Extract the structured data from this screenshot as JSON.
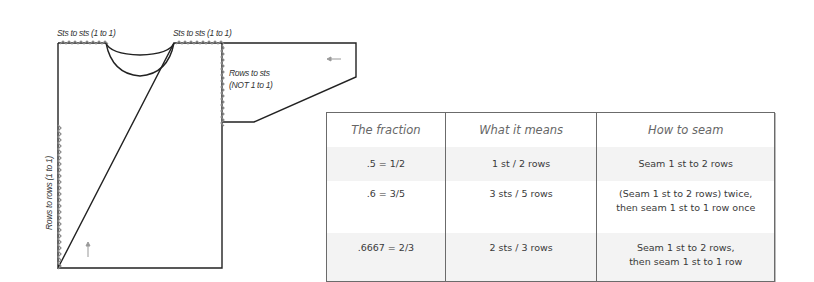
{
  "diagram": {
    "labels": {
      "shoulder_left": "Sts to sts (1 to 1)",
      "shoulder_right": "Sts to sts (1 to 1)",
      "armhole_line1": "Rows to sts",
      "armhole_line2": "(NOT 1 to 1)",
      "side": "Rows to rows (1 to 1)"
    },
    "arrows": [
      {
        "name": "sleeve-direction-arrow",
        "direction": "left"
      },
      {
        "name": "body-direction-arrow",
        "direction": "up"
      }
    ],
    "colors": {
      "outline": "#222222",
      "seam_zigzag": "#8a8a8a",
      "arrow": "#999999"
    }
  },
  "table": {
    "headers": [
      "The fraction",
      "What it means",
      "How to seam"
    ],
    "rows": [
      {
        "fraction": ".5 = 1/2",
        "meaning": "1 st / 2 rows",
        "how": [
          "Seam 1 st to 2 rows"
        ]
      },
      {
        "fraction": ".6 = 3/5",
        "meaning": "3 sts / 5 rows",
        "how": [
          "(Seam 1 st to 2 rows) twice,",
          "then seam 1 st to 1 row once"
        ]
      },
      {
        "fraction": ".6667 = 2/3",
        "meaning": "2 sts / 3 rows",
        "how": [
          "Seam 1 st to 2 rows,",
          "then seam 1 st to 1 row"
        ]
      }
    ],
    "colors": {
      "border": "#6b6b6b",
      "shaded_row": "#f3f3f3",
      "header_text": "#666666",
      "body_text": "#3a3a3a"
    }
  }
}
